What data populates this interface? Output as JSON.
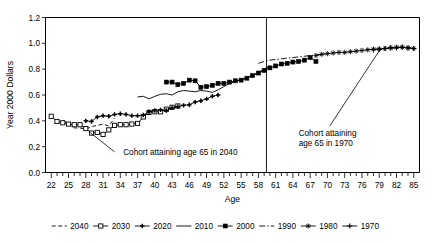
{
  "chart_data": {
    "type": "line",
    "title": "",
    "xlabel": "Age",
    "ylabel": "Year 2000 Dollars",
    "xlim": [
      21,
      86
    ],
    "ylim": [
      0.0,
      1.2
    ],
    "grid": false,
    "legend_position": "bottom",
    "x_tick_labels": [
      "22",
      "25",
      "28",
      "31",
      "34",
      "37",
      "40",
      "43",
      "46",
      "49",
      "52",
      "55",
      "58",
      "61",
      "64",
      "67",
      "70",
      "73",
      "76",
      "79",
      "82",
      "85"
    ],
    "x_tick_values": [
      22,
      25,
      28,
      31,
      34,
      37,
      40,
      43,
      46,
      49,
      52,
      55,
      58,
      61,
      64,
      67,
      70,
      73,
      76,
      79,
      82,
      85
    ],
    "y_tick_labels": [
      "0.0",
      "0.2",
      "0.4",
      "0.6",
      "0.8",
      "1.0",
      "1.2"
    ],
    "y_tick_values": [
      0.0,
      0.2,
      0.4,
      0.6,
      0.8,
      1.0,
      1.2
    ],
    "annotations": [
      {
        "name": "annotation-2040",
        "text_line1": "Cohort attaining age 65 in 2040",
        "text_line2": "",
        "text_x": 34.5,
        "text_y": 0.135,
        "leader_from_x": 33.0,
        "leader_from_y": 0.16,
        "leader_to_x": 28.6,
        "leader_to_y": 0.315
      },
      {
        "name": "annotation-1970",
        "text_line1": "Cohort attaining",
        "text_line2": "age 65 in 1970",
        "text_x": 65.0,
        "text_y": 0.285,
        "leader_from_x": 70.4,
        "leader_from_y": 0.36,
        "leader_to_x": 79.2,
        "leader_to_y": 0.955
      }
    ],
    "reference_line": {
      "name": "vertical-reference-line",
      "x": 59.4,
      "y_from": 0.0,
      "y_to": 1.2
    },
    "series": [
      {
        "name": "2040",
        "marker": "none",
        "dash": "dashed",
        "x": [
          24.0,
          25.0,
          26.0,
          27.0,
          28.0,
          29.0,
          30.0,
          31.0,
          32.0,
          33.0
        ],
        "values": [
          0.405,
          0.375,
          0.345,
          0.345,
          0.335,
          0.355,
          0.365,
          0.375,
          0.36,
          0.42
        ]
      },
      {
        "name": "2030",
        "marker": "open-square",
        "dash": "solid",
        "x": [
          22.0,
          23.0,
          24.0,
          25.0,
          26.0,
          27.0,
          28.0,
          29.0,
          30.0,
          31.0,
          32.0,
          33.0,
          34.0,
          35.0,
          36.0,
          37.0,
          38.0,
          39.0,
          40.0,
          41.0,
          42.0,
          43.0,
          44.0
        ],
        "values": [
          0.435,
          0.395,
          0.385,
          0.375,
          0.37,
          0.37,
          0.34,
          0.305,
          0.31,
          0.295,
          0.33,
          0.365,
          0.37,
          0.37,
          0.375,
          0.38,
          0.43,
          0.465,
          0.47,
          0.47,
          0.49,
          0.505,
          0.515
        ]
      },
      {
        "name": "2020",
        "marker": "small-plus",
        "dash": "solid",
        "x": [
          28.0,
          29.0,
          30.0,
          31.0,
          32.0,
          33.0,
          34.0,
          35.0,
          36.0,
          37.0,
          38.0,
          39.0,
          40.0,
          41.0,
          42.0,
          43.0,
          44.0,
          45.0,
          46.0,
          47.0,
          48.0,
          49.0,
          50.0,
          51.0
        ],
        "values": [
          0.4,
          0.395,
          0.43,
          0.44,
          0.435,
          0.45,
          0.455,
          0.45,
          0.44,
          0.44,
          0.445,
          0.47,
          0.48,
          0.485,
          0.48,
          0.5,
          0.51,
          0.52,
          0.525,
          0.545,
          0.555,
          0.57,
          0.59,
          0.6
        ]
      },
      {
        "name": "2010",
        "marker": "none",
        "dash": "solid",
        "x": [
          37.0,
          38.0,
          39.0,
          40.0,
          41.0,
          42.0,
          43.0,
          44.0,
          45.0,
          46.0,
          47.0,
          48.0,
          49.0,
          50.0,
          51.0,
          52.0,
          53.0,
          54.0,
          55.0,
          56.0,
          57.0,
          58.0,
          59.0,
          60.0
        ],
        "values": [
          0.585,
          0.59,
          0.57,
          0.59,
          0.605,
          0.61,
          0.6,
          0.625,
          0.635,
          0.63,
          0.625,
          0.635,
          0.63,
          0.62,
          0.64,
          0.665,
          0.69,
          0.705,
          0.72,
          0.735,
          0.755,
          0.775,
          0.8,
          0.825
        ]
      },
      {
        "name": "2000",
        "marker": "filled-square",
        "dash": "solid",
        "x": [
          42.0,
          43.0,
          44.0,
          45.0,
          46.0,
          47.0,
          48.0,
          49.0,
          50.0,
          51.0,
          52.0,
          53.0,
          54.0,
          55.0,
          56.0,
          57.0,
          58.0,
          59.0,
          60.0,
          61.0,
          62.0,
          63.0,
          64.0,
          65.0,
          66.0,
          67.0,
          68.0
        ],
        "values": [
          0.7,
          0.7,
          0.68,
          0.69,
          0.715,
          0.71,
          0.66,
          0.665,
          0.675,
          0.69,
          0.69,
          0.7,
          0.71,
          0.715,
          0.73,
          0.75,
          0.77,
          0.79,
          0.81,
          0.825,
          0.84,
          0.845,
          0.855,
          0.86,
          0.87,
          0.89,
          0.86
        ]
      },
      {
        "name": "1990",
        "marker": "none",
        "dash": "dash-dot",
        "x": [
          58.0,
          59.0,
          60.0,
          61.0,
          62.0,
          63.0,
          64.0,
          65.0,
          66.0,
          67.0,
          68.0,
          69.0,
          70.0
        ],
        "values": [
          0.845,
          0.86,
          0.87,
          0.875,
          0.88,
          0.885,
          0.89,
          0.895,
          0.9,
          0.905,
          0.91,
          0.915,
          0.92
        ]
      },
      {
        "name": "1980",
        "marker": "star",
        "dash": "solid",
        "x": [
          68.0,
          69.0,
          70.0,
          71.0,
          72.0,
          73.0,
          74.0,
          75.0,
          76.0,
          77.0,
          78.0,
          79.0,
          80.0,
          81.0,
          82.0,
          83.0,
          84.0,
          85.0
        ],
        "values": [
          0.905,
          0.915,
          0.92,
          0.925,
          0.93,
          0.93,
          0.935,
          0.94,
          0.945,
          0.95,
          0.955,
          0.955,
          0.96,
          0.965,
          0.97,
          0.97,
          0.965,
          0.96
        ]
      },
      {
        "name": "1970",
        "marker": "plus",
        "dash": "solid",
        "x": [
          78.0,
          79.0,
          80.0,
          81.0,
          82.0,
          83.0,
          84.0,
          85.0
        ],
        "values": [
          0.95,
          0.955,
          0.96,
          0.965,
          0.965,
          0.97,
          0.965,
          0.96
        ]
      }
    ]
  },
  "legend": {
    "items": [
      {
        "label": "2040",
        "marker": "none",
        "dash": "dashed"
      },
      {
        "label": "2030",
        "marker": "open-square",
        "dash": "solid"
      },
      {
        "label": "2020",
        "marker": "small-plus",
        "dash": "solid"
      },
      {
        "label": "2010",
        "marker": "none",
        "dash": "solid"
      },
      {
        "label": "2000",
        "marker": "filled-square",
        "dash": "solid"
      },
      {
        "label": "1990",
        "marker": "none",
        "dash": "dash-dot"
      },
      {
        "label": "1980",
        "marker": "star",
        "dash": "solid"
      },
      {
        "label": "1970",
        "marker": "plus",
        "dash": "solid"
      }
    ]
  }
}
